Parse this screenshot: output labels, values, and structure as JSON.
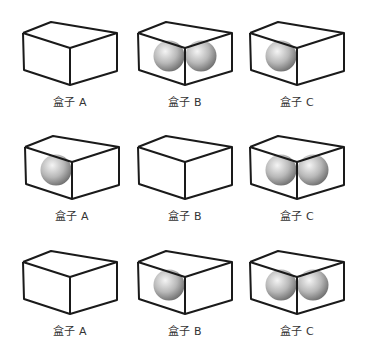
{
  "diagram": {
    "rows": [
      {
        "boxes": [
          {
            "label": "盒子 A",
            "balls": 0,
            "cx": 70,
            "top": 22,
            "ball_positions": []
          },
          {
            "label": "盒子 B",
            "balls": 2,
            "cx": 185,
            "top": 22,
            "ball_positions": [
              "left",
              "right"
            ]
          },
          {
            "label": "盒子 C",
            "balls": 1,
            "cx": 297,
            "top": 22,
            "ball_positions": [
              "left"
            ]
          }
        ]
      },
      {
        "boxes": [
          {
            "label": "盒子 A",
            "balls": 1,
            "cx": 72,
            "top": 136,
            "ball_positions": [
              "left"
            ]
          },
          {
            "label": "盒子 B",
            "balls": 0,
            "cx": 185,
            "top": 136,
            "ball_positions": []
          },
          {
            "label": "盒子 C",
            "balls": 2,
            "cx": 297,
            "top": 136,
            "ball_positions": [
              "left",
              "right"
            ]
          }
        ]
      },
      {
        "boxes": [
          {
            "label": "盒子 A",
            "balls": 0,
            "cx": 70,
            "top": 251,
            "ball_positions": []
          },
          {
            "label": "盒子 B",
            "balls": 1,
            "cx": 185,
            "top": 251,
            "ball_positions": [
              "left"
            ]
          },
          {
            "label": "盒子 C",
            "balls": 2,
            "cx": 297,
            "top": 251,
            "ball_positions": [
              "left",
              "right"
            ]
          }
        ]
      }
    ]
  },
  "colors": {
    "stroke": "#1a1a1a",
    "label": "#333333",
    "ball_light": "#f2f2f2",
    "ball_mid": "#b5b5b5",
    "ball_dark": "#6e6e6e"
  }
}
